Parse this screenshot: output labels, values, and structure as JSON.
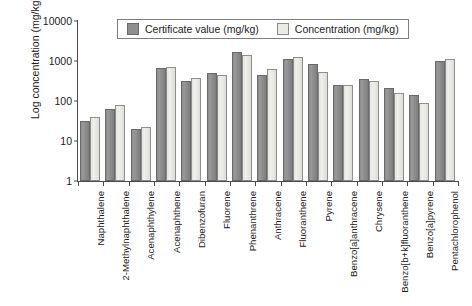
{
  "chart_data": {
    "type": "bar",
    "title": "",
    "xlabel": "",
    "ylabel": "Log concentration (mg/kg)",
    "yscale": "log",
    "ylim": [
      1,
      10000
    ],
    "ytick_labels": [
      "10000",
      "1000",
      "100",
      "10",
      "1"
    ],
    "ytick_values": [
      10000,
      1000,
      100,
      10,
      1
    ],
    "grid": false,
    "legend_position": "top-center",
    "categories": [
      "Naphthalene",
      "2-Methylnaphthalene",
      "Acenaphthylene",
      "Acenaphthene",
      "Dibenzofuran",
      "Fluorene",
      "Phenanthrene",
      "Anthracene",
      "Fluoranthene",
      "Pyrene",
      "Benzo[a]anthracene",
      "Chrysene",
      "Benzo[b+k]fluoranthene",
      "Benzo[a]pyrene",
      "Pentachlorophenol"
    ],
    "series": [
      {
        "name": "Certificate value (mg/kg)",
        "color": "#8e8e8e",
        "values": [
          32,
          63,
          20,
          650,
          320,
          500,
          1700,
          450,
          1100,
          830,
          250,
          350,
          215,
          140,
          1000
        ]
      },
      {
        "name": "Concentration (mg/kg)",
        "color": "#eceae7",
        "values": [
          41,
          80,
          22,
          700,
          380,
          460,
          1450,
          620,
          1250,
          520,
          250,
          320,
          160,
          90,
          1100
        ]
      }
    ]
  },
  "legend": {
    "items": [
      {
        "label": "Certificate value (mg/kg)"
      },
      {
        "label": "Concentration (mg/kg)"
      }
    ]
  }
}
